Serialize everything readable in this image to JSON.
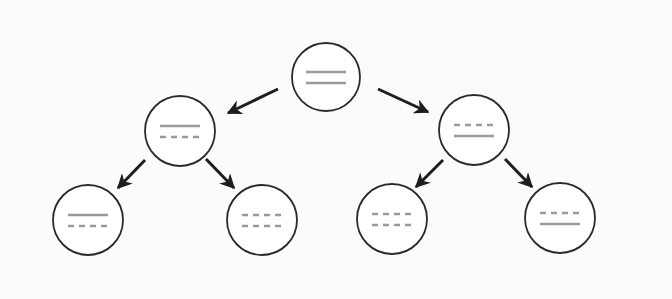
{
  "diagram": {
    "type": "binary-tree",
    "colors": {
      "background": "#fbfbfb",
      "node_fill": "#ffffff",
      "node_stroke": "#2a2a2a",
      "line_color": "#9a9a9a",
      "arrow_color": "#1e1e1e"
    },
    "nodes": [
      {
        "id": "root",
        "cx": 326,
        "cy": 77,
        "r": 34,
        "lines": [
          "solid",
          "solid"
        ]
      },
      {
        "id": "left",
        "cx": 180,
        "cy": 131,
        "r": 35,
        "lines": [
          "solid",
          "dashed"
        ]
      },
      {
        "id": "right",
        "cx": 474,
        "cy": 130,
        "r": 35,
        "lines": [
          "dashed",
          "solid"
        ]
      },
      {
        "id": "left-left",
        "cx": 88,
        "cy": 220,
        "r": 35,
        "lines": [
          "solid",
          "dashed"
        ]
      },
      {
        "id": "left-right",
        "cx": 262,
        "cy": 220,
        "r": 35,
        "lines": [
          "dashed",
          "dashed"
        ]
      },
      {
        "id": "right-left",
        "cx": 392,
        "cy": 219,
        "r": 35,
        "lines": [
          "dashed",
          "dashed"
        ]
      },
      {
        "id": "right-right",
        "cx": 560,
        "cy": 218,
        "r": 35,
        "lines": [
          "dashed",
          "solid"
        ]
      }
    ],
    "edges": [
      {
        "from": "root",
        "to": "left",
        "x1": 278,
        "y1": 89,
        "x2": 228,
        "y2": 113
      },
      {
        "from": "root",
        "to": "right",
        "x1": 378,
        "y1": 89,
        "x2": 428,
        "y2": 112
      },
      {
        "from": "left",
        "to": "left-left",
        "x1": 145,
        "y1": 160,
        "x2": 118,
        "y2": 188
      },
      {
        "from": "left",
        "to": "left-right",
        "x1": 206,
        "y1": 159,
        "x2": 234,
        "y2": 188
      },
      {
        "from": "right",
        "to": "right-left",
        "x1": 443,
        "y1": 160,
        "x2": 416,
        "y2": 187
      },
      {
        "from": "right",
        "to": "right-right",
        "x1": 505,
        "y1": 159,
        "x2": 532,
        "y2": 187
      }
    ]
  }
}
